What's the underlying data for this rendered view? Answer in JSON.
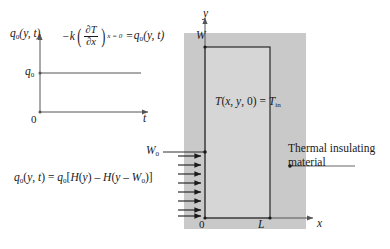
{
  "figure": {
    "type": "heat-conduction-boundary-value-diagram"
  },
  "flux_plot": {
    "y_axis_label": "q0(y, t)",
    "y_axis_tick_label": "q0",
    "x_axis_label": "t",
    "origin_label": "0",
    "series": {
      "name": "applied surface heat flux",
      "style": "constant step, horizontal",
      "level_label": "q0"
    }
  },
  "flux_equation": {
    "minus_k": "−k",
    "numerator": "∂T",
    "denominator": "∂x",
    "subscript": "x = 0",
    "equals": "=",
    "right_side": "q0(y, t)",
    "full_text": "-k(∂T/∂x)_{x=0} = q0(y, t)"
  },
  "domain": {
    "y_axis_label": "y",
    "x_axis_label": "x",
    "origin_label": "0",
    "height_label": "W",
    "width_label": "L",
    "initial_condition": "T(x, y, 0) = T",
    "initial_condition_subscript": "in",
    "initial_condition_full": "T(x, y, 0) = T_in"
  },
  "annotations": {
    "insulating_material_line1": "Thermal insulating",
    "insulating_material_line2": "material",
    "heated_extent_label": "W",
    "heated_extent_subscript": "0"
  },
  "boundary_condition": {
    "lhs": "q0(y, t)",
    "equals": "=",
    "rhs_prefix": "q0[H(y) – H(y – W",
    "rhs_subscript": "0",
    "rhs_suffix": ")]",
    "full_text": "q0(y, t) = q0[H(y) - H(y - W0)]",
    "arrow_count": 8,
    "arrow_direction": "right"
  },
  "colors": {
    "stroke": "#1a1a1a",
    "axis": "#555555",
    "insulation_fill": "#c9c9c9",
    "slab_fill": "#d6d6d6",
    "background": "#ffffff"
  }
}
